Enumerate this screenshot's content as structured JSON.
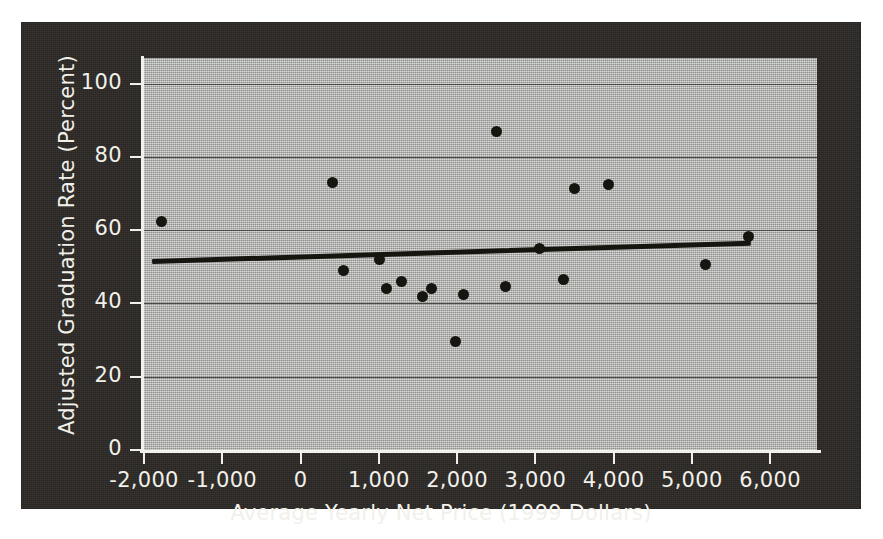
{
  "chart_data": {
    "type": "scatter",
    "title": "",
    "xlabel": "Average Yearly Net Price (1999 Dollars)",
    "ylabel": "Adjusted Graduation Rate (Percent)",
    "xlim": [
      -2000,
      6600
    ],
    "ylim": [
      0,
      107
    ],
    "xticks": [
      -2000,
      -1000,
      0,
      1000,
      2000,
      3000,
      4000,
      5000,
      6000
    ],
    "xtick_labels": [
      "-2,000",
      "-1,000",
      "0",
      "1,000",
      "2,000",
      "3,000",
      "4,000",
      "5,000",
      "6,000"
    ],
    "yticks": [
      0,
      20,
      40,
      60,
      80,
      100
    ],
    "ytick_labels": [
      "0",
      "20",
      "40",
      "60",
      "80",
      "100"
    ],
    "grid": "horizontal",
    "legend": "none",
    "marker_color": "#17150f",
    "plot_background": "#b9b9b6",
    "figure_background": "#2a2724",
    "gridline_color": "#4a4a48",
    "axis_color": "#f2f0ea",
    "series": [
      {
        "name": "Institutions",
        "points": [
          {
            "x": -1780,
            "y": 62.5
          },
          {
            "x": 415,
            "y": 73.0
          },
          {
            "x": 545,
            "y": 49.0
          },
          {
            "x": 1010,
            "y": 52.0
          },
          {
            "x": 1105,
            "y": 44.0
          },
          {
            "x": 1295,
            "y": 46.0
          },
          {
            "x": 1555,
            "y": 42.0
          },
          {
            "x": 1680,
            "y": 44.0
          },
          {
            "x": 1975,
            "y": 29.5
          },
          {
            "x": 2080,
            "y": 42.5
          },
          {
            "x": 2510,
            "y": 87.0
          },
          {
            "x": 2615,
            "y": 44.5
          },
          {
            "x": 3055,
            "y": 55.0
          },
          {
            "x": 3365,
            "y": 46.5
          },
          {
            "x": 3505,
            "y": 71.5
          },
          {
            "x": 3935,
            "y": 72.5
          },
          {
            "x": 5170,
            "y": 50.7
          },
          {
            "x": 5730,
            "y": 58.3
          }
        ]
      }
    ],
    "trendline": {
      "name": "Fitted regression line",
      "x_start": -1900,
      "y_start": 51.5,
      "x_end": 5750,
      "y_end": 56.5
    }
  }
}
